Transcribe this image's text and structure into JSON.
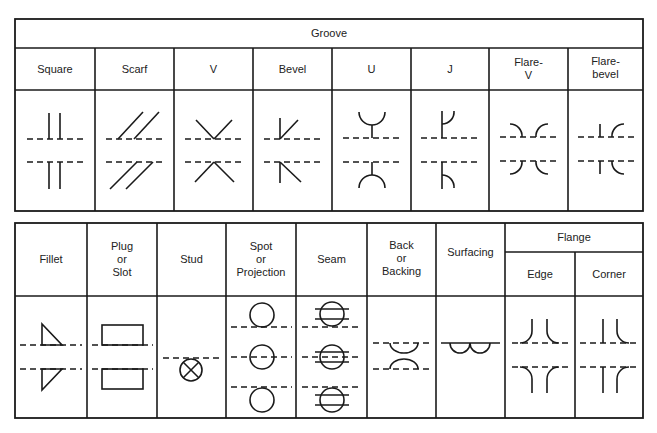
{
  "groove": {
    "title": "Groove",
    "columns": [
      {
        "key": "square",
        "lines": [
          "Square"
        ]
      },
      {
        "key": "scarf",
        "lines": [
          "Scarf"
        ]
      },
      {
        "key": "v",
        "lines": [
          "V"
        ]
      },
      {
        "key": "bevel",
        "lines": [
          "Bevel"
        ]
      },
      {
        "key": "u",
        "lines": [
          "U"
        ]
      },
      {
        "key": "j",
        "lines": [
          "J"
        ]
      },
      {
        "key": "flare-v",
        "lines": [
          "Flare-",
          "V"
        ]
      },
      {
        "key": "flare-bevel",
        "lines": [
          "Flare-",
          "bevel"
        ]
      }
    ]
  },
  "other": {
    "columns": [
      {
        "key": "fillet",
        "lines": [
          "Fillet"
        ]
      },
      {
        "key": "plug-slot",
        "lines": [
          "Plug",
          "or",
          "Slot"
        ]
      },
      {
        "key": "stud",
        "lines": [
          "Stud"
        ]
      },
      {
        "key": "spot-projection",
        "lines": [
          "Spot",
          "or",
          "Projection"
        ]
      },
      {
        "key": "seam",
        "lines": [
          "Seam"
        ]
      },
      {
        "key": "back-backing",
        "lines": [
          "Back",
          "or",
          "Backing"
        ]
      },
      {
        "key": "surfacing",
        "lines": [
          "Surfacing"
        ]
      }
    ],
    "flange": {
      "title": "Flange",
      "columns": [
        {
          "key": "edge",
          "lines": [
            "Edge"
          ]
        },
        {
          "key": "corner",
          "lines": [
            "Corner"
          ]
        }
      ]
    }
  },
  "colors": {
    "line": "#1a1a1a",
    "background": "#ffffff"
  }
}
